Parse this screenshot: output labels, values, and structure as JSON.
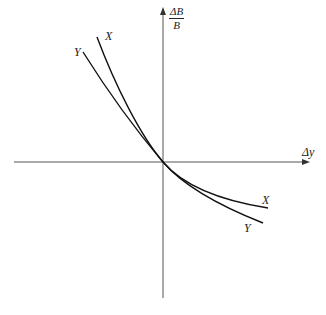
{
  "diagram": {
    "axes": {
      "x_label": "Δy",
      "y_label_numerator": "ΔB",
      "y_label_denominator": "B",
      "color": "#555555"
    },
    "curves": [
      {
        "name": "X",
        "label": "X",
        "label_top": "X",
        "label_bottom": "X",
        "color": "#111111"
      },
      {
        "name": "Y",
        "label": "Y",
        "label_top": "Y",
        "label_bottom": "Y",
        "color": "#111111"
      }
    ]
  }
}
